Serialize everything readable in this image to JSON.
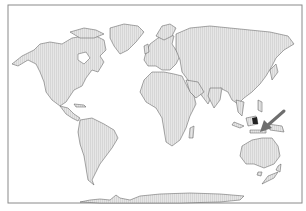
{
  "map": {
    "projection": "world-equirectangular-like",
    "frame": {
      "x": 8,
      "y": 5,
      "width": 294,
      "height": 198,
      "stroke": "#8a8a8a"
    },
    "land_fill": "#e4e4e4",
    "land_stroke": "#555555",
    "water_fill": "#ffffff",
    "highlight_fill": "#222222",
    "continents": [
      "North America",
      "Greenland",
      "South America",
      "Europe",
      "Africa",
      "Asia",
      "Australia",
      "Antarctica",
      "New Zealand"
    ],
    "annotation": {
      "type": "arrow",
      "color": "#6e6e6e",
      "from": [
        283,
        112
      ],
      "to": [
        262,
        131
      ],
      "points_to": "Philippines / Sulawesi region"
    }
  }
}
